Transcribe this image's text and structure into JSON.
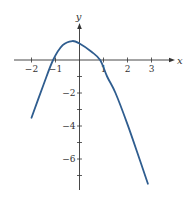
{
  "chart_data": {
    "type": "line",
    "title": "",
    "xlabel": "x",
    "ylabel": "y",
    "xlim": [
      -2.4,
      3.8
    ],
    "ylim": [
      -8,
      2.2
    ],
    "grid": false,
    "legend": null,
    "x_ticks": [
      -2,
      -1,
      1,
      2,
      3
    ],
    "x_tick_labels": [
      "−2",
      "−1",
      "1",
      "2",
      "3"
    ],
    "y_ticks": [
      -1,
      -2,
      -3,
      -4,
      -5,
      -6,
      -7
    ],
    "y_tick_labels": [
      "",
      "−2",
      "",
      "−4",
      "",
      "−6",
      ""
    ],
    "series": [
      {
        "name": "f(x)",
        "color": "#2f5d8f",
        "x": [
          -2.0,
          -1.5,
          -1.1,
          -0.7,
          -0.3,
          0.0,
          0.5,
          0.86,
          1.15,
          1.5,
          2.0,
          2.5,
          2.85
        ],
        "y": [
          -3.5,
          -1.5,
          0.0,
          0.9,
          1.15,
          1.0,
          0.5,
          0.0,
          -1.0,
          -2.0,
          -3.9,
          -6.0,
          -7.5
        ]
      }
    ],
    "features": {
      "maximum": {
        "x": -0.3,
        "y": 1.15
      },
      "y_intercept": 1.0,
      "x_intercepts": [
        -1.1,
        0.86
      ]
    }
  },
  "axes": {
    "x_label": "x",
    "y_label": "y",
    "axis_color": "#333333"
  },
  "mapping": {
    "origin_px": [
      79.5,
      60
    ],
    "px_per_unit_x": 24,
    "px_per_unit_y": 16.5
  }
}
